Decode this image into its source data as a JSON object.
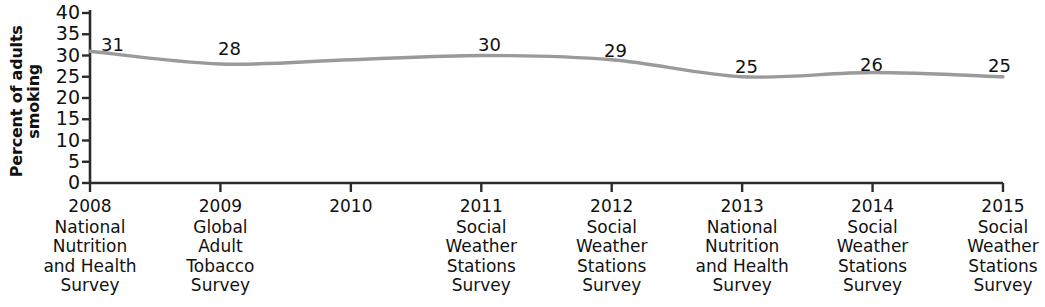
{
  "chart_data": {
    "type": "line",
    "title": "",
    "xlabel": "",
    "ylabel": "Percent of adults smoking",
    "ylabel_lines": [
      "Percent of adults",
      "smoking"
    ],
    "ylim": [
      0,
      40
    ],
    "yticks": [
      40,
      35,
      30,
      25,
      20,
      15,
      10,
      5,
      0
    ],
    "grid": false,
    "legend": null,
    "line_color": "#9a9a9a",
    "x": [
      "2008",
      "2009",
      "2010",
      "2011",
      "2012",
      "2013",
      "2014",
      "2015"
    ],
    "categories": [
      "2008",
      "2009",
      "2010",
      "2011",
      "2012",
      "2013",
      "2014",
      "2015"
    ],
    "values": [
      31,
      28,
      null,
      30,
      29,
      25,
      26,
      25
    ],
    "point_labels": [
      "31",
      "28",
      "",
      "30",
      "29",
      "25",
      "26",
      "25"
    ],
    "series": [
      {
        "name": "Percent of adults smoking",
        "values": [
          31,
          28,
          null,
          30,
          29,
          25,
          26,
          25
        ]
      }
    ],
    "xtick_sources": [
      "National Nutrition and Health Survey",
      "Global Adult Tobacco Survey",
      "",
      "Social Weather Stations Survey",
      "Social Weather Stations Survey",
      "National Nutrition and Health Survey",
      "Social Weather Stations Survey",
      "Social Weather Stations Survey"
    ]
  },
  "axis": {
    "y_title_line1": "Percent of adults",
    "y_title_line2": "smoking",
    "y_ticks": [
      "40",
      "35",
      "30",
      "25",
      "20",
      "15",
      "10",
      "5",
      "0"
    ]
  },
  "x_axis": {
    "ticks": [
      {
        "year": "2008",
        "survey_lines": [
          "National",
          "Nutrition",
          "and Health",
          "Survey"
        ]
      },
      {
        "year": "2009",
        "survey_lines": [
          "Global",
          "Adult",
          "Tobacco",
          "Survey"
        ]
      },
      {
        "year": "2010",
        "survey_lines": []
      },
      {
        "year": "2011",
        "survey_lines": [
          "Social",
          "Weather",
          "Stations",
          "Survey"
        ]
      },
      {
        "year": "2012",
        "survey_lines": [
          "Social",
          "Weather",
          "Stations",
          "Survey"
        ]
      },
      {
        "year": "2013",
        "survey_lines": [
          "National",
          "Nutrition",
          "and Health",
          "Survey"
        ]
      },
      {
        "year": "2014",
        "survey_lines": [
          "Social",
          "Weather",
          "Stations",
          "Survey"
        ]
      },
      {
        "year": "2015",
        "survey_lines": [
          "Social",
          "Weather",
          "Stations",
          "Survey"
        ]
      }
    ]
  },
  "value_labels": [
    {
      "text": "31",
      "x": 101,
      "y": 36
    },
    {
      "text": "28",
      "x": 218,
      "y": 40
    },
    {
      "text": "30",
      "x": 478,
      "y": 36
    },
    {
      "text": "29",
      "x": 604,
      "y": 42
    },
    {
      "text": "25",
      "x": 735,
      "y": 58
    },
    {
      "text": "26",
      "x": 860,
      "y": 56
    },
    {
      "text": "25",
      "x": 988,
      "y": 57
    }
  ],
  "colors": {
    "line": "#9a9a9a",
    "axis": "#2b2b2b",
    "text": "#111111",
    "background": "#ffffff"
  }
}
